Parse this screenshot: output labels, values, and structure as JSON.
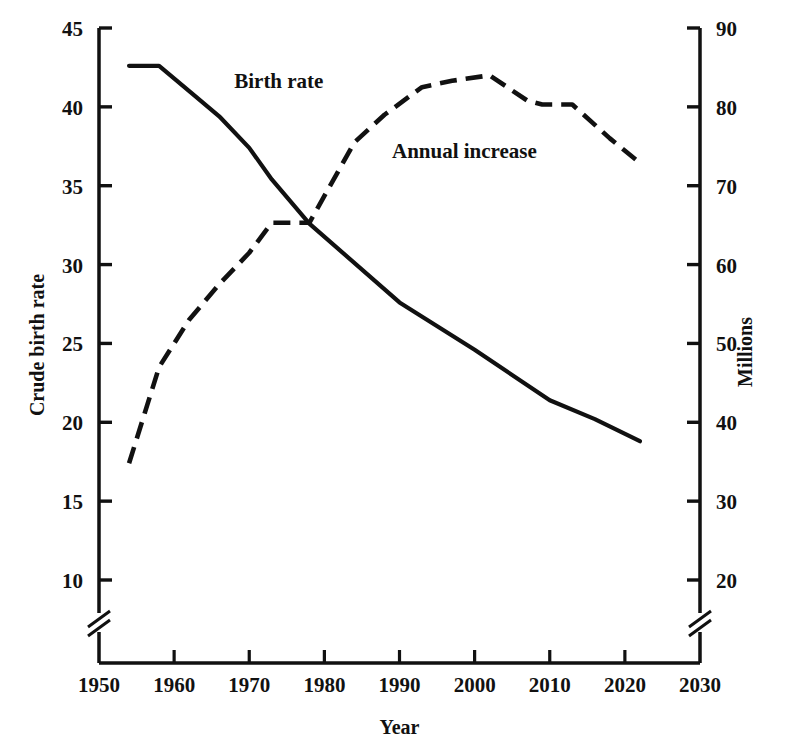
{
  "chart_data": {
    "type": "line",
    "title": "",
    "xlabel": "Year",
    "ylabel": "Crude birth rate",
    "y2label": "Millions",
    "xlim": [
      1950,
      2030
    ],
    "ylim": [
      10,
      45
    ],
    "y2lim": [
      20,
      90
    ],
    "x_ticks": [
      "1950",
      "1960",
      "1970",
      "1980",
      "1990",
      "2000",
      "2010",
      "2020",
      "2030"
    ],
    "y_ticks": [
      "10",
      "15",
      "20",
      "25",
      "30",
      "35",
      "40",
      "45"
    ],
    "y2_ticks": [
      "20",
      "30",
      "40",
      "50",
      "60",
      "70",
      "80",
      "90"
    ],
    "grid": false,
    "legend_position": "inline-annotations",
    "axis_break_left": true,
    "axis_break_right": true,
    "series": [
      {
        "name": "Birth rate",
        "axis": "left",
        "style": "solid",
        "label_x": 1968,
        "label_y": 41.2,
        "points": [
          {
            "x": 1954,
            "y": 42.6
          },
          {
            "x": 1958,
            "y": 42.6
          },
          {
            "x": 1963,
            "y": 40.6
          },
          {
            "x": 1966,
            "y": 39.4
          },
          {
            "x": 1970,
            "y": 37.4
          },
          {
            "x": 1973,
            "y": 35.4
          },
          {
            "x": 1978,
            "y": 32.6
          },
          {
            "x": 1990,
            "y": 27.6
          },
          {
            "x": 2000,
            "y": 24.6
          },
          {
            "x": 2010,
            "y": 21.4
          },
          {
            "x": 2016,
            "y": 20.2
          },
          {
            "x": 2022,
            "y": 18.8
          }
        ]
      },
      {
        "name": "Annual increase",
        "axis": "right",
        "style": "dashed",
        "label_x": 1989,
        "label_y2": 73.5,
        "points": [
          {
            "x": 1954,
            "y": 34.8
          },
          {
            "x": 1958,
            "y": 47.0
          },
          {
            "x": 1962,
            "y": 53.0
          },
          {
            "x": 1966,
            "y": 57.5
          },
          {
            "x": 1970,
            "y": 61.5
          },
          {
            "x": 1973,
            "y": 65.3
          },
          {
            "x": 1978,
            "y": 65.3
          },
          {
            "x": 1984,
            "y": 75.5
          },
          {
            "x": 1988,
            "y": 79.0
          },
          {
            "x": 1993,
            "y": 82.5
          },
          {
            "x": 1997,
            "y": 83.3
          },
          {
            "x": 2002,
            "y": 84.0
          },
          {
            "x": 2007,
            "y": 80.8
          },
          {
            "x": 2009,
            "y": 80.3
          },
          {
            "x": 2013,
            "y": 80.3
          },
          {
            "x": 2018,
            "y": 76.0
          },
          {
            "x": 2022,
            "y": 72.9
          }
        ]
      }
    ]
  }
}
